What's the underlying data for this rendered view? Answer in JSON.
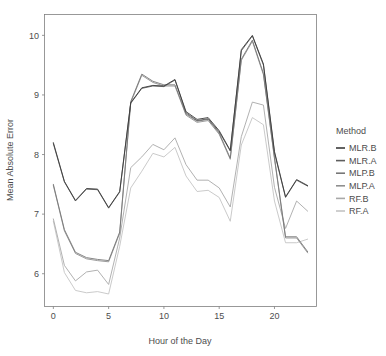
{
  "chart_data": {
    "type": "line",
    "title": "",
    "xlabel": "Hour of the Day",
    "ylabel": "Mean Absolute Error",
    "xlim": [
      -0.8,
      23.8
    ],
    "ylim": [
      5.45,
      10.35
    ],
    "xticks": [
      0,
      5,
      10,
      15,
      20
    ],
    "xtick_labels": [
      "0",
      "5",
      "10",
      "15",
      "20"
    ],
    "yticks": [
      6,
      7,
      8,
      9,
      10
    ],
    "ytick_labels": [
      "6",
      "7",
      "8",
      "9",
      "10"
    ],
    "grid": false,
    "legend_position": "right",
    "legend_title": "Method",
    "x": [
      0,
      1,
      2,
      3,
      4,
      5,
      6,
      7,
      8,
      9,
      10,
      11,
      12,
      13,
      14,
      15,
      16,
      17,
      18,
      19,
      20,
      21,
      22,
      23
    ],
    "series": [
      {
        "name": "MLR.B",
        "color": "#3b3b3b",
        "values": [
          8.2,
          7.55,
          7.23,
          7.43,
          7.42,
          7.11,
          7.38,
          8.87,
          9.12,
          9.16,
          9.15,
          9.26,
          8.72,
          8.59,
          8.62,
          8.4,
          8.07,
          9.76,
          10.0,
          9.52,
          8.05,
          7.29,
          7.58,
          7.48
        ]
      },
      {
        "name": "MLR.A",
        "color": "#5e5e5e",
        "values": [
          8.18,
          7.54,
          7.22,
          7.42,
          7.41,
          7.1,
          7.37,
          8.86,
          9.11,
          9.15,
          9.14,
          9.25,
          8.7,
          8.57,
          8.6,
          8.38,
          8.06,
          9.74,
          9.99,
          9.5,
          8.03,
          7.28,
          7.57,
          7.47
        ]
      },
      {
        "name": "MLP.B",
        "color": "#777777",
        "values": [
          7.5,
          6.74,
          6.36,
          6.27,
          6.24,
          6.22,
          6.7,
          8.89,
          9.35,
          9.23,
          9.17,
          9.17,
          8.68,
          8.56,
          8.59,
          8.36,
          7.94,
          9.6,
          9.92,
          9.36,
          7.95,
          6.62,
          6.62,
          6.37
        ]
      },
      {
        "name": "MLP.A",
        "color": "#8f8f8f",
        "values": [
          7.48,
          6.72,
          6.34,
          6.25,
          6.22,
          6.2,
          6.68,
          8.87,
          9.33,
          9.21,
          9.15,
          9.15,
          8.66,
          8.54,
          8.57,
          8.34,
          7.92,
          9.58,
          9.9,
          9.34,
          7.93,
          6.6,
          6.6,
          6.35
        ]
      },
      {
        "name": "RF.B",
        "color": "#a8a8a8",
        "values": [
          6.92,
          6.14,
          5.88,
          6.03,
          6.06,
          5.82,
          6.6,
          7.78,
          7.96,
          8.17,
          8.08,
          8.28,
          7.83,
          7.57,
          7.57,
          7.44,
          7.12,
          8.3,
          8.88,
          8.83,
          7.45,
          6.76,
          7.22,
          7.05
        ]
      },
      {
        "name": "RF.A",
        "color": "#c4c4c4",
        "values": [
          6.88,
          6.02,
          5.72,
          5.68,
          5.7,
          5.66,
          6.46,
          7.44,
          7.72,
          8.02,
          7.96,
          8.12,
          7.64,
          7.38,
          7.4,
          7.28,
          6.88,
          8.16,
          8.62,
          8.5,
          7.22,
          6.52,
          6.52,
          6.58
        ]
      }
    ]
  },
  "legend": {
    "title": "Method",
    "entries": [
      "MLR.B",
      "MLR.A",
      "MLP.B",
      "MLP.A",
      "RF.B",
      "RF.A"
    ]
  },
  "axes": {
    "x_title": "Hour of the Day",
    "y_title": "Mean Absolute Error"
  },
  "colors": {
    "panel_background": "#ffffff",
    "panel_border": "#7f7f7f",
    "text": "#4d4d4d"
  }
}
